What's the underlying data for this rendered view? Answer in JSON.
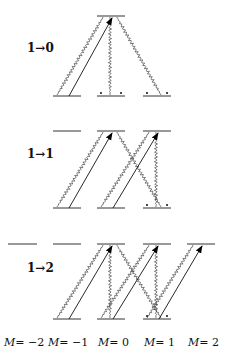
{
  "diagram": {
    "columns_x": {
      "-2": [
        8,
        37
      ],
      "-1": [
        53,
        81
      ],
      "0": [
        97,
        125
      ],
      "1": [
        143,
        171
      ],
      "2": [
        187,
        215
      ]
    },
    "panels": [
      {
        "label": "1→0",
        "label_pos": [
          27,
          52
        ],
        "upper_y": 16,
        "lower_y": 96,
        "upper_levels": [
          "0"
        ],
        "lower_levels": [
          "-1",
          "0",
          "1"
        ],
        "lasers": [
          {
            "from": "-1",
            "to": "0"
          }
        ],
        "decays": [
          {
            "from": "0",
            "to": "-1"
          },
          {
            "from": "0",
            "to": "0"
          },
          {
            "from": "0",
            "to": "1"
          }
        ],
        "dark_markers": [
          "0",
          "1"
        ]
      },
      {
        "label": "1→1",
        "label_pos": [
          27,
          158
        ],
        "upper_y": 131,
        "lower_y": 208,
        "upper_levels": [
          "-1",
          "0",
          "1"
        ],
        "lower_levels": [
          "-1",
          "0",
          "1"
        ],
        "lasers": [
          {
            "from": "-1",
            "to": "0"
          },
          {
            "from": "0",
            "to": "1"
          }
        ],
        "decays": [
          {
            "from": "0",
            "to": "-1"
          },
          {
            "from": "0",
            "to": "1"
          },
          {
            "from": "1",
            "to": "0"
          },
          {
            "from": "1",
            "to": "1"
          }
        ],
        "dark_markers": [
          "1"
        ]
      },
      {
        "label": "1→2",
        "label_pos": [
          27,
          272
        ],
        "upper_y": 244,
        "lower_y": 319,
        "upper_levels": [
          "-2",
          "-1",
          "0",
          "1",
          "2"
        ],
        "lower_levels": [
          "-1",
          "0",
          "1"
        ],
        "lasers": [
          {
            "from": "-1",
            "to": "0"
          },
          {
            "from": "0",
            "to": "1"
          },
          {
            "from": "1",
            "to": "2"
          }
        ],
        "decays": [
          {
            "from": "0",
            "to": "-1"
          },
          {
            "from": "0",
            "to": "0"
          },
          {
            "from": "0",
            "to": "1"
          },
          {
            "from": "1",
            "to": "0"
          },
          {
            "from": "1",
            "to": "1"
          },
          {
            "from": "2",
            "to": "1"
          }
        ],
        "dark_markers": [
          "1"
        ]
      }
    ],
    "m_labels": [
      {
        "text": "M= −2",
        "x": 4
      },
      {
        "text": "M= −1",
        "x": 48
      },
      {
        "text": "M= 0",
        "x": 98
      },
      {
        "text": "M= 1",
        "x": 144
      },
      {
        "text": "M= 2",
        "x": 188
      }
    ],
    "m_label_y": 346
  }
}
